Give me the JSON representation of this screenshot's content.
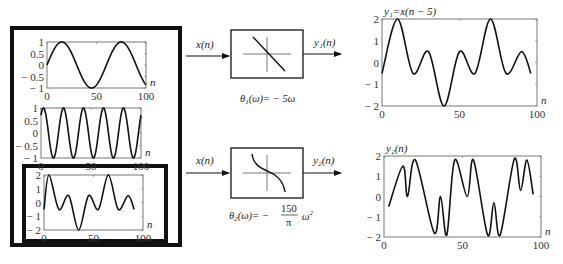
{
  "figure": {
    "input_signal_label": "x(n)",
    "left_panel": {
      "plots": [
        {
          "id": "sin_slow",
          "yticks": [
            "1",
            "0.5",
            "0",
            "− 0.5",
            "− 1"
          ],
          "xticks": [
            "0",
            "50",
            "100"
          ],
          "xlabel": "n"
        },
        {
          "id": "sin_fast",
          "yticks": [
            "1",
            "0.5",
            "0",
            "− 0.5",
            "− 1"
          ],
          "xticks": [
            "0",
            "50",
            "100"
          ],
          "xlabel": "n"
        },
        {
          "id": "sum",
          "yticks": [
            "2",
            "1",
            "0",
            "− 1",
            "− 2"
          ],
          "xticks": [
            "0",
            "50",
            "100"
          ],
          "xlabel": "n"
        }
      ]
    },
    "systems": [
      {
        "input_label": "x(n)",
        "output_label": "y₁(n)",
        "phase_formula": "θ₁(ω)= − 5ω",
        "phase_prefix": "θ",
        "phase_sub": "1",
        "phase_rest": "(ω)= − 5ω",
        "response_shape": "linear"
      },
      {
        "input_label": "x(n)",
        "output_label": "y₂(n)",
        "phase_prefix": "θ",
        "phase_sub": "2",
        "phase_rest": "(ω)= −",
        "phase_num": "150",
        "phase_den": "π",
        "phase_tail": "ω",
        "phase_exp": "2",
        "response_shape": "nonlinear"
      }
    ],
    "right_panel": {
      "plots": [
        {
          "title": "y₁=x(n − 5)",
          "yticks": [
            "2",
            "1",
            "0",
            "− 1",
            "− 2"
          ],
          "xticks": [
            "0",
            "50",
            "100"
          ],
          "xlabel": "n"
        },
        {
          "title": "y₂(n)",
          "yticks": [
            "2",
            "1",
            "0",
            "− 1",
            "− 2"
          ],
          "xticks": [
            "0",
            "50",
            "100"
          ],
          "xlabel": "n"
        }
      ]
    }
  },
  "chart_data": [
    {
      "type": "line",
      "title": "",
      "xlabel": "n",
      "ylabel": "",
      "xlim": [
        0,
        100
      ],
      "ylim": [
        -1,
        1
      ],
      "description": "low-frequency sinusoid, period ~60 samples",
      "period": 60,
      "amplitude": 1,
      "phase_shift": 0
    },
    {
      "type": "line",
      "title": "",
      "xlabel": "n",
      "ylabel": "",
      "xlim": [
        0,
        100
      ],
      "ylim": [
        -1,
        1
      ],
      "description": "higher-frequency sinusoid, period ~20 samples",
      "period": 20,
      "amplitude": 1,
      "phase_shift": 0
    },
    {
      "type": "line",
      "title": "",
      "xlabel": "n",
      "ylabel": "",
      "xlim": [
        0,
        100
      ],
      "ylim": [
        -2,
        2
      ],
      "description": "x(n): sum of two sinusoids; peaks 2 at n~10 and n~70, min -2 at n~45"
    },
    {
      "type": "line",
      "title": "y₁=x(n − 5)",
      "xlabel": "n",
      "ylabel": "",
      "xlim": [
        0,
        100
      ],
      "ylim": [
        -2,
        2
      ],
      "x": [
        0,
        10,
        20,
        30,
        40,
        50,
        60,
        70,
        80,
        90,
        96
      ],
      "values": [
        -0.5,
        2,
        -0.5,
        0.5,
        -2,
        0.5,
        -0.5,
        2,
        -0.5,
        0.5,
        -0.5
      ]
    },
    {
      "type": "line",
      "title": "y₂(n)",
      "xlabel": "n",
      "ylabel": "",
      "xlim": [
        0,
        100
      ],
      "ylim": [
        -2,
        2
      ],
      "x": [
        3,
        12,
        15,
        20,
        32,
        36,
        40,
        45,
        53,
        57,
        66,
        70,
        74,
        83,
        87,
        91,
        95
      ],
      "values": [
        -0.5,
        1.5,
        0,
        1.8,
        -1.8,
        0,
        -1.9,
        1.8,
        0,
        1.8,
        -1.9,
        -0.3,
        -1.9,
        1.85,
        0.3,
        1.8,
        0.1
      ]
    }
  ]
}
